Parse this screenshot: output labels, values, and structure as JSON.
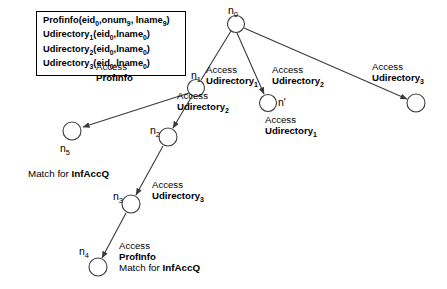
{
  "diagram": {
    "definition_box": {
      "lines": [
        {
          "name": "Profinfo",
          "args": "(eid<sub>0</sub>,onum<sub>9</sub>, lname<sub>9</sub>)",
          "text": "Profinfo(eid0,onum9, lname9)"
        },
        {
          "name": "Udirectory<sub>1</sub>",
          "args": "(eid<sub>0</sub>,lname<sub>0</sub>)",
          "text": "Udirectory1(eid0,lname0)"
        },
        {
          "name": "Udirectory<sub>2</sub>",
          "args": "(eid<sub>0</sub>,lname<sub>0</sub>)",
          "text": "Udirectory2(eid0,lname0)"
        },
        {
          "name": "Udirectory<sub>3</sub>",
          "args": "(eid<sub>0</sub>,lname<sub>0</sub>)",
          "text": "Udirectory3(eid0,lname0)"
        }
      ]
    },
    "nodes": [
      {
        "id": "n0",
        "label": "n",
        "sub": "0",
        "cx": 236,
        "cy": 24,
        "r": 8.5
      },
      {
        "id": "n1",
        "label": "n",
        "sub": "1",
        "cx": 196,
        "cy": 88,
        "r": 8.5
      },
      {
        "id": "nprime",
        "label": "n'",
        "sub": "",
        "cx": 268,
        "cy": 103,
        "r": 8.5
      },
      {
        "id": "nright",
        "label": "",
        "sub": "",
        "cx": 416,
        "cy": 103,
        "r": 9
      },
      {
        "id": "n5",
        "label": "n",
        "sub": "5",
        "cx": 72,
        "cy": 131,
        "r": 9
      },
      {
        "id": "n2",
        "label": "n",
        "sub": "2",
        "cx": 168,
        "cy": 137,
        "r": 9
      },
      {
        "id": "n3",
        "label": "n",
        "sub": "3",
        "cx": 131,
        "cy": 204,
        "r": 9
      },
      {
        "id": "n4",
        "label": "n",
        "sub": "4",
        "cx": 98,
        "cy": 267,
        "r": 9
      }
    ],
    "edge_labels": [
      {
        "id": "access-profinfo-n1-n5",
        "verb": "Access",
        "op": "ProfInfo",
        "op_sub": ""
      },
      {
        "id": "access-udirectory2-n1-n2",
        "verb": "Access",
        "op": "Udirectory",
        "op_sub": "2"
      },
      {
        "id": "access-udirectory1-n0-n1",
        "verb": "Access",
        "op": "Udirectory",
        "op_sub": "1"
      },
      {
        "id": "access-udirectory2-n0-nprime",
        "verb": "Access",
        "op": "Udirectory",
        "op_sub": "2"
      },
      {
        "id": "access-udirectory3-n0-nright",
        "verb": "Access",
        "op": "Udirectory",
        "op_sub": "3"
      },
      {
        "id": "access-udirectory1-nprime",
        "verb": "Access",
        "op": "Udirectory",
        "op_sub": "1"
      },
      {
        "id": "access-udirectory3-n2-n3",
        "verb": "Access",
        "op": "Udirectory",
        "op_sub": "3"
      },
      {
        "id": "access-profinfo-n3-n4",
        "verb": "Access",
        "op": "ProfInfo",
        "op_sub": ""
      }
    ],
    "annotations": [
      {
        "id": "match-n5",
        "prefix": "Match for ",
        "strong": "InfAccQ"
      },
      {
        "id": "match-n4",
        "prefix": "Match for ",
        "strong": "InfAccQ"
      }
    ],
    "colors": {
      "stroke": "#3a3a3a",
      "text": "#000000",
      "background": "#ffffff"
    }
  }
}
